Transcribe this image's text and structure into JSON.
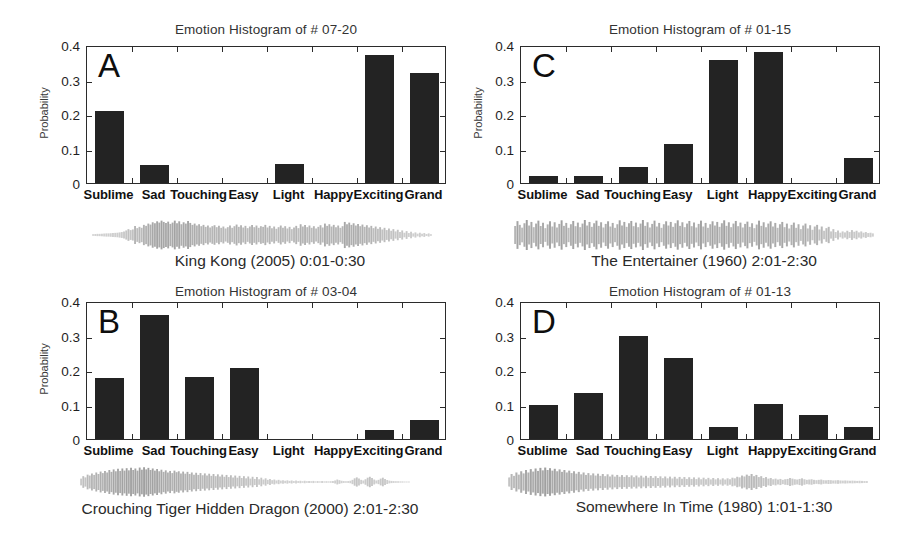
{
  "figure": {
    "background": "#ffffff",
    "bar_color": "#232323",
    "axis_color": "#2b2b2b",
    "waveform_color": "#8a8a8a"
  },
  "categories": [
    "Sublime",
    "Sad",
    "Touching",
    "Easy",
    "Light",
    "Happy",
    "Exciting",
    "Grand"
  ],
  "y_ticks": [
    "0",
    "0.1",
    "0.2",
    "0.3",
    "0.4"
  ],
  "y_axis_title": "Probability",
  "panels": [
    {
      "letter": "A",
      "title": "Emotion Histogram of # 07-20",
      "caption": "King Kong (2005) 0:01-0:30",
      "show_y_title": true
    },
    {
      "letter": "C",
      "title": "Emotion Histogram of # 01-15",
      "caption": "The Entertainer (1960) 2:01-2:30",
      "show_y_title": true
    },
    {
      "letter": "B",
      "title": "Emotion Histogram of # 03-04",
      "caption": "Crouching Tiger Hidden Dragon (2000)  2:01-2:30",
      "show_y_title": true
    },
    {
      "letter": "D",
      "title": "Emotion Histogram of # 01-13",
      "caption": "Somewhere In Time (1980) 1:01-1:30",
      "show_y_title": false
    }
  ],
  "chart_data": [
    {
      "type": "bar",
      "panel": "A",
      "title": "Emotion Histogram of # 07-20",
      "subtitle": "King Kong (2005) 0:01-0:30",
      "xlabel": "",
      "ylabel": "Probability",
      "ylim": [
        0,
        0.4
      ],
      "yticks": [
        0,
        0.1,
        0.2,
        0.3,
        0.4
      ],
      "grid": false,
      "legend": "none",
      "categories": [
        "Sublime",
        "Sad",
        "Touching",
        "Easy",
        "Light",
        "Happy",
        "Exciting",
        "Grand"
      ],
      "values": [
        0.21,
        0.053,
        0.0,
        0.0,
        0.055,
        0.0,
        0.37,
        0.318
      ]
    },
    {
      "type": "bar",
      "panel": "C",
      "title": "Emotion Histogram of # 01-15",
      "subtitle": "The Entertainer (1960) 2:01-2:30",
      "xlabel": "",
      "ylabel": "Probability",
      "ylim": [
        0,
        0.4
      ],
      "yticks": [
        0,
        0.1,
        0.2,
        0.3,
        0.4
      ],
      "grid": false,
      "legend": "none",
      "categories": [
        "Sublime",
        "Sad",
        "Touching",
        "Easy",
        "Light",
        "Happy",
        "Exciting",
        "Grand"
      ],
      "values": [
        0.02,
        0.021,
        0.045,
        0.112,
        0.358,
        0.381,
        0.0,
        0.072
      ]
    },
    {
      "type": "bar",
      "panel": "B",
      "title": "Emotion Histogram of # 03-04",
      "subtitle": "Crouching Tiger Hidden Dragon (2000)  2:01-2:30",
      "xlabel": "",
      "ylabel": "Probability",
      "ylim": [
        0,
        0.4
      ],
      "yticks": [
        0,
        0.1,
        0.2,
        0.3,
        0.4
      ],
      "grid": false,
      "legend": "none",
      "categories": [
        "Sublime",
        "Sad",
        "Touching",
        "Easy",
        "Light",
        "Happy",
        "Exciting",
        "Grand"
      ],
      "values": [
        0.178,
        0.36,
        0.18,
        0.206,
        0.0,
        0.0,
        0.026,
        0.055
      ]
    },
    {
      "type": "bar",
      "panel": "D",
      "title": "Emotion Histogram of # 01-13",
      "subtitle": "Somewhere In Time (1980) 1:01-1:30",
      "xlabel": "",
      "ylabel": "Probability",
      "ylim": [
        0,
        0.4
      ],
      "yticks": [
        0,
        0.1,
        0.2,
        0.3,
        0.4
      ],
      "grid": false,
      "legend": "none",
      "categories": [
        "Sublime",
        "Sad",
        "Touching",
        "Easy",
        "Light",
        "Happy",
        "Exciting",
        "Grand"
      ],
      "values": [
        0.1,
        0.134,
        0.3,
        0.235,
        0.035,
        0.101,
        0.071,
        0.036
      ]
    }
  ],
  "waveforms": [
    {
      "panel": "A",
      "envelope": [
        0.05,
        0.06,
        0.07,
        0.07,
        0.08,
        0.09,
        0.1,
        0.1,
        0.11,
        0.12,
        0.13,
        0.14,
        0.16,
        0.18,
        0.22,
        0.28,
        0.36,
        0.3,
        0.34,
        0.55,
        0.42,
        0.5,
        0.44,
        0.62,
        0.56,
        0.7,
        0.64,
        0.78,
        0.72,
        0.84,
        0.76,
        0.88,
        0.8,
        0.74,
        0.82,
        0.68,
        0.76,
        0.88,
        0.72,
        0.84,
        0.66,
        0.78,
        0.7,
        0.86,
        0.74,
        0.62,
        0.7,
        0.58,
        0.66,
        0.54,
        0.62,
        0.5,
        0.58,
        0.46,
        0.54,
        0.6,
        0.48,
        0.56,
        0.44,
        0.52,
        0.4,
        0.48,
        0.58,
        0.44,
        0.54,
        0.64,
        0.5,
        0.6,
        0.46,
        0.56,
        0.42,
        0.52,
        0.62,
        0.48,
        0.58,
        0.44,
        0.54,
        0.5,
        0.62,
        0.46,
        0.56,
        0.42,
        0.52,
        0.38,
        0.48,
        0.58,
        0.44,
        0.54,
        0.4,
        0.5,
        0.36,
        0.46,
        0.56,
        0.42,
        0.66,
        0.52,
        0.62,
        0.48,
        0.58,
        0.44,
        0.54,
        0.4,
        0.5,
        0.6,
        0.46,
        0.7,
        0.56,
        0.66,
        0.52,
        0.62,
        0.48,
        0.58,
        0.44,
        0.54,
        0.8,
        0.66,
        0.76,
        0.62,
        0.72,
        0.58,
        0.68,
        0.54,
        0.64,
        0.5,
        0.6,
        0.46,
        0.56,
        0.42,
        0.52,
        0.38,
        0.48,
        0.34,
        0.44,
        0.3,
        0.4,
        0.26,
        0.36,
        0.22,
        0.32,
        0.18,
        0.28,
        0.14,
        0.24,
        0.12,
        0.2,
        0.1,
        0.16,
        0.08,
        0.14,
        0.07,
        0.12,
        0.06,
        0.1,
        0.05
      ]
    },
    {
      "panel": "C",
      "envelope": [
        0.55,
        0.85,
        0.62,
        0.45,
        0.72,
        0.92,
        0.58,
        0.8,
        0.48,
        0.7,
        0.88,
        0.55,
        0.75,
        0.42,
        0.65,
        0.85,
        0.52,
        0.78,
        0.46,
        0.68,
        0.9,
        0.56,
        0.74,
        0.44,
        0.66,
        0.86,
        0.54,
        0.76,
        0.48,
        0.7,
        0.92,
        0.58,
        0.8,
        0.5,
        0.72,
        0.88,
        0.56,
        0.78,
        0.46,
        0.68,
        0.84,
        0.52,
        0.74,
        0.44,
        0.66,
        0.9,
        0.58,
        0.8,
        0.5,
        0.72,
        0.86,
        0.54,
        0.76,
        0.48,
        0.7,
        0.92,
        0.56,
        0.78,
        0.46,
        0.68,
        0.88,
        0.52,
        0.74,
        0.44,
        0.66,
        0.84,
        0.58,
        0.8,
        0.5,
        0.72,
        0.9,
        0.56,
        0.78,
        0.48,
        0.7,
        0.86,
        0.54,
        0.76,
        0.46,
        0.68,
        0.88,
        0.52,
        0.74,
        0.44,
        0.66,
        0.84,
        0.58,
        0.8,
        0.5,
        0.72,
        0.9,
        0.56,
        0.78,
        0.48,
        0.7,
        0.86,
        0.54,
        0.76,
        0.46,
        0.68,
        0.82,
        0.5,
        0.72,
        0.42,
        0.64,
        0.88,
        0.56,
        0.78,
        0.48,
        0.7,
        0.84,
        0.52,
        0.74,
        0.44,
        0.66,
        0.8,
        0.48,
        0.7,
        0.4,
        0.62,
        0.76,
        0.44,
        0.66,
        0.36,
        0.58,
        0.7,
        0.4,
        0.6,
        0.32,
        0.52,
        0.62,
        0.34,
        0.52,
        0.26,
        0.42,
        0.5,
        0.22,
        0.36,
        0.18,
        0.28,
        0.14,
        0.22,
        0.16,
        0.26,
        0.18,
        0.3,
        0.2,
        0.26,
        0.16,
        0.22,
        0.14,
        0.18,
        0.12,
        0.14,
        0.1
      ]
    },
    {
      "panel": "B",
      "envelope": [
        0.22,
        0.38,
        0.3,
        0.48,
        0.42,
        0.56,
        0.46,
        0.62,
        0.52,
        0.68,
        0.58,
        0.72,
        0.62,
        0.78,
        0.66,
        0.82,
        0.7,
        0.86,
        0.72,
        0.88,
        0.74,
        0.9,
        0.76,
        0.92,
        0.78,
        0.88,
        0.74,
        0.94,
        0.8,
        0.96,
        0.82,
        0.92,
        0.78,
        0.88,
        0.74,
        0.84,
        0.7,
        0.8,
        0.66,
        0.76,
        0.62,
        0.72,
        0.58,
        0.74,
        0.64,
        0.7,
        0.56,
        0.68,
        0.54,
        0.66,
        0.52,
        0.62,
        0.48,
        0.6,
        0.46,
        0.58,
        0.44,
        0.56,
        0.42,
        0.54,
        0.4,
        0.52,
        0.38,
        0.5,
        0.36,
        0.48,
        0.34,
        0.46,
        0.32,
        0.44,
        0.3,
        0.42,
        0.28,
        0.4,
        0.26,
        0.38,
        0.24,
        0.36,
        0.22,
        0.34,
        0.2,
        0.32,
        0.18,
        0.28,
        0.16,
        0.24,
        0.14,
        0.2,
        0.12,
        0.16,
        0.1,
        0.14,
        0.09,
        0.12,
        0.08,
        0.11,
        0.07,
        0.1,
        0.06,
        0.09,
        0.06,
        0.08,
        0.05,
        0.08,
        0.05,
        0.07,
        0.05,
        0.07,
        0.04,
        0.06,
        0.04,
        0.06,
        0.04,
        0.05,
        0.04,
        0.05,
        0.06,
        0.1,
        0.16,
        0.12,
        0.08,
        0.06,
        0.05,
        0.06,
        0.08,
        0.14,
        0.24,
        0.3,
        0.22,
        0.14,
        0.1,
        0.18,
        0.28,
        0.34,
        0.26,
        0.16,
        0.1,
        0.14,
        0.22,
        0.28,
        0.2,
        0.13,
        0.09,
        0.07,
        0.06,
        0.05,
        0.05,
        0.04,
        0.04,
        0.03,
        0.03,
        0.03
      ]
    },
    {
      "panel": "D",
      "envelope": [
        0.3,
        0.52,
        0.4,
        0.62,
        0.48,
        0.7,
        0.56,
        0.78,
        0.62,
        0.84,
        0.68,
        0.88,
        0.72,
        0.92,
        0.76,
        0.94,
        0.78,
        0.9,
        0.74,
        0.86,
        0.7,
        0.82,
        0.66,
        0.78,
        0.62,
        0.74,
        0.58,
        0.7,
        0.54,
        0.66,
        0.5,
        0.62,
        0.46,
        0.58,
        0.44,
        0.56,
        0.42,
        0.54,
        0.4,
        0.52,
        0.38,
        0.5,
        0.36,
        0.48,
        0.35,
        0.46,
        0.34,
        0.45,
        0.33,
        0.44,
        0.32,
        0.43,
        0.31,
        0.42,
        0.3,
        0.41,
        0.29,
        0.4,
        0.28,
        0.39,
        0.27,
        0.38,
        0.26,
        0.37,
        0.25,
        0.36,
        0.24,
        0.35,
        0.23,
        0.34,
        0.22,
        0.33,
        0.21,
        0.32,
        0.2,
        0.31,
        0.2,
        0.3,
        0.19,
        0.29,
        0.18,
        0.28,
        0.18,
        0.27,
        0.17,
        0.26,
        0.17,
        0.25,
        0.16,
        0.24,
        0.16,
        0.24,
        0.18,
        0.28,
        0.24,
        0.34,
        0.3,
        0.42,
        0.36,
        0.48,
        0.4,
        0.52,
        0.38,
        0.46,
        0.32,
        0.38,
        0.26,
        0.32,
        0.22,
        0.26,
        0.18,
        0.22,
        0.16,
        0.2,
        0.14,
        0.18,
        0.2,
        0.26,
        0.22,
        0.18,
        0.16,
        0.2,
        0.24,
        0.18,
        0.14,
        0.16,
        0.18,
        0.14,
        0.12,
        0.14,
        0.16,
        0.12,
        0.11,
        0.13,
        0.12,
        0.1,
        0.11,
        0.12,
        0.1,
        0.09,
        0.1,
        0.09,
        0.08,
        0.09,
        0.08,
        0.07,
        0.08,
        0.07,
        0.06,
        0.06
      ]
    }
  ]
}
